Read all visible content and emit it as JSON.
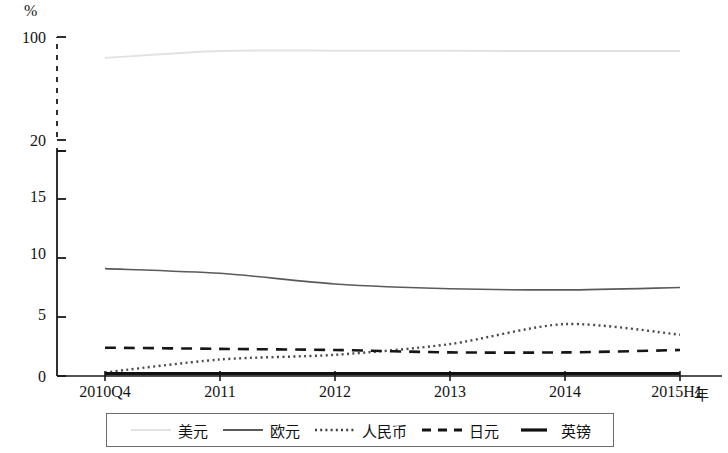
{
  "chart_data": {
    "type": "line",
    "title": "",
    "xlabel": "年",
    "ylabel": "%",
    "y_unit": "%",
    "categories": [
      "2010Q4",
      "2011",
      "2012",
      "2013",
      "2014",
      "2015H1"
    ],
    "ytick_labels": [
      "0",
      "5",
      "10",
      "15",
      "20",
      "100"
    ],
    "ytick_values": [
      0,
      5,
      10,
      15,
      20,
      100
    ],
    "ylim": [
      0,
      100
    ],
    "axis_break": {
      "between": [
        20,
        100
      ],
      "style": "dashed"
    },
    "grid": false,
    "legend_position": "bottom",
    "series": [
      {
        "name": "美元",
        "style": "solid-light",
        "color": "#e2e2e2",
        "width": 2,
        "values": [
          87.0,
          92.6,
          92.9,
          92.8,
          92.6,
          92.7
        ]
      },
      {
        "name": "欧元",
        "style": "solid",
        "color": "#5a5a5a",
        "width": 1.6,
        "values": [
          9.1,
          8.7,
          7.8,
          7.4,
          7.3,
          7.5
        ]
      },
      {
        "name": "人民币",
        "style": "dotted",
        "color": "#4a4a4a",
        "width": 2.4,
        "values": [
          0.3,
          1.4,
          1.8,
          2.7,
          4.4,
          3.5
        ]
      },
      {
        "name": "日元",
        "style": "dashed",
        "color": "#161616",
        "width": 2.6,
        "values": [
          2.4,
          2.3,
          2.2,
          2.0,
          2.0,
          2.2
        ]
      },
      {
        "name": "英镑",
        "style": "solid-thick",
        "color": "#111111",
        "width": 3.2,
        "values": [
          0.2,
          0.2,
          0.2,
          0.2,
          0.2,
          0.2
        ]
      }
    ]
  },
  "axes": {
    "y_unit_label": "%",
    "x_unit_label": "年"
  },
  "legend": {
    "items": [
      {
        "label": "美元"
      },
      {
        "label": "欧元"
      },
      {
        "label": "人民币"
      },
      {
        "label": "日元"
      },
      {
        "label": "英镑"
      }
    ]
  },
  "ytick_labels": {
    "t0": "0",
    "t5": "5",
    "t10": "10",
    "t15": "15",
    "t20": "20",
    "t100": "100"
  },
  "xtick_labels": {
    "x0": "2010Q4",
    "x1": "2011",
    "x2": "2012",
    "x3": "2013",
    "x4": "2014",
    "x5": "2015H1"
  }
}
